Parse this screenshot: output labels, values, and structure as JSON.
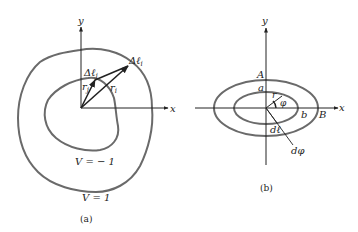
{
  "figure_a": {
    "axis_x": "x",
    "axis_y": "y",
    "delta_l_j": "Δℓ",
    "delta_l_j_sub": "j",
    "delta_l_i": "Δℓ",
    "delta_l_i_sub": "i",
    "r_j": "r",
    "r_j_sub": "j",
    "r_i": "r",
    "r_i_sub": "i",
    "inner_contour_label": "V = − 1",
    "outer_contour_label": "V = 1",
    "caption": "(a)"
  },
  "figure_b": {
    "axis_x": "x",
    "axis_y": "y",
    "outer_top": "A",
    "inner_top": "a",
    "radius": "r",
    "angle": "φ",
    "inner_right": "b",
    "outer_right": "B",
    "arc_element": "dℓ",
    "angle_element": "dφ",
    "caption": "(b)"
  },
  "colors": {
    "ink": "#222222",
    "contour": "#6a6a6a"
  }
}
